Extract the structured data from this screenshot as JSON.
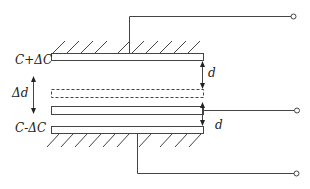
{
  "diagram": {
    "type": "differential-capacitor-schematic",
    "colors": {
      "stroke": "#444444",
      "background": "#ffffff",
      "text": "#222222"
    },
    "labels": {
      "top_capacitance": "C+ΔC",
      "bottom_capacitance": "C-ΔC",
      "displacement": "Δd",
      "gap_top": "d",
      "gap_bottom": "d"
    },
    "components": {
      "fixed_plate_top": "fixed top electrode (hatched, grounded-style mount)",
      "movable_plate_rest": "movable plate displaced position (dashed)",
      "movable_plate": "movable middle electrode",
      "fixed_plate_bottom": "fixed bottom electrode (hatched mount)",
      "terminals": [
        "top terminal",
        "middle terminal",
        "bottom terminal"
      ]
    }
  }
}
